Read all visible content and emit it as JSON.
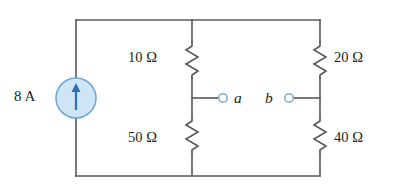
{
  "figure": {
    "name": "circuit-diagram"
  },
  "source": {
    "label": "8 A",
    "symbol": "current-source",
    "arrow_direction": "up",
    "fill_color": "#cfe4f5",
    "stroke_color": "#6aa6d6",
    "arrow_color": "#2f6fb5"
  },
  "resistors": [
    {
      "id": "r-top-middle",
      "label": "10 Ω",
      "value": 10,
      "unit": "Ω",
      "branch": "middle",
      "position": "top"
    },
    {
      "id": "r-bottom-middle",
      "label": "50 Ω",
      "value": 50,
      "unit": "Ω",
      "branch": "middle",
      "position": "bottom"
    },
    {
      "id": "r-top-right",
      "label": "20 Ω",
      "value": 20,
      "unit": "Ω",
      "branch": "right",
      "position": "top"
    },
    {
      "id": "r-bottom-right",
      "label": "40 Ω",
      "value": 40,
      "unit": "Ω",
      "branch": "right",
      "position": "bottom"
    }
  ],
  "terminals": [
    {
      "id": "terminal-a",
      "label": "a",
      "side": "left",
      "stroke_color": "#7aa9cf"
    },
    {
      "id": "terminal-b",
      "label": "b",
      "side": "right",
      "stroke_color": "#7aa9cf"
    }
  ],
  "wires": {
    "color": "#58585a",
    "width": 1.6
  }
}
